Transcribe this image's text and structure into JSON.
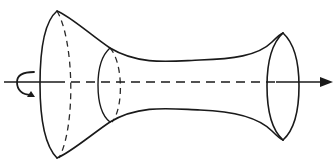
{
  "figure": {
    "canvas": {
      "width": 336,
      "height": 167
    },
    "colors": {
      "background": "#ffffff",
      "stroke": "#1a1a1a",
      "hidden_stroke": "#2a2a2a"
    },
    "axis": {
      "name": "axis-of-revolution",
      "y": 82,
      "solid_left": {
        "x1": 4,
        "x2": 56
      },
      "dashed_middle": {
        "x1": 56,
        "x2": 276
      },
      "solid_right": {
        "x1": 276,
        "x2": 322
      },
      "arrowhead": {
        "tip_x": 333,
        "base_x": 320,
        "half_height": 5
      }
    },
    "rotation_arrow": {
      "name": "rotation-direction-arrow",
      "center": {
        "x": 26,
        "y": 82
      },
      "radius_x": 9,
      "radius_y": 13,
      "opening": "right"
    },
    "left_rim": {
      "name": "left-rim-ellipse",
      "center_x": 57,
      "center_y": 84,
      "半": 0,
      "top_y": 11,
      "bottom_y": 158,
      "half_width": 17,
      "front_arc": "solid",
      "back_arc": "dashed"
    },
    "throat_ellipse": {
      "name": "throat-ellipse",
      "center_x": 110,
      "center_y": 85,
      "top_y": 48,
      "bottom_y": 122,
      "half_width": 12,
      "front_arc": "solid",
      "back_arc": "dashed"
    },
    "right_rim": {
      "name": "right-rim-ellipse",
      "center_x": 283,
      "center_y": 86,
      "top_y": 33,
      "bottom_y": 140,
      "half_width": 16,
      "front_arc": "solid",
      "back_arc": "solid"
    },
    "profile": {
      "top_start": {
        "x": 57,
        "y": 11
      },
      "top_throat": {
        "x": 110,
        "y": 48
      },
      "top_waist": {
        "x": 200,
        "y": 60
      },
      "top_end": {
        "x": 283,
        "y": 33
      },
      "bottom_start": {
        "x": 57,
        "y": 158
      },
      "bottom_throat": {
        "x": 110,
        "y": 122
      },
      "bottom_waist": {
        "x": 200,
        "y": 110
      },
      "bottom_end": {
        "x": 283,
        "y": 140
      }
    }
  }
}
